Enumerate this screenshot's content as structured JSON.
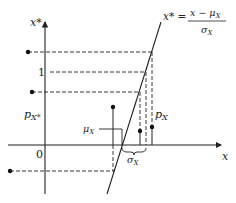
{
  "figure": {
    "axes": {
      "vertical_label": "x*",
      "horizontal_label": "x",
      "origin_label": "0",
      "unit_tick_label": "1"
    },
    "transform_label": {
      "lhs": "x* =",
      "numerator": "x − μ",
      "numerator_sub": "X",
      "denominator": "σ",
      "denominator_sub": "X"
    },
    "annotations": {
      "p_x_star": "p",
      "p_x_star_sub": "X*",
      "mu_x": "μ",
      "mu_x_sub": "X",
      "sigma_x": "σ",
      "sigma_x_sub": "X",
      "p_x": "p",
      "p_x_sub": "X"
    }
  }
}
